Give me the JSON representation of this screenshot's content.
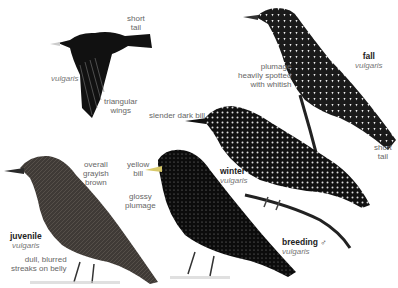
{
  "plate": {
    "species_latin": "vulgaris",
    "labels": {
      "flight_short_tail": [
        "short",
        "tail"
      ],
      "flight_vulgaris": "vulgaris",
      "flight_wings": [
        "triangular",
        "wings"
      ],
      "slender_bill": "slender dark bill",
      "fall_plumage": [
        "plumage",
        "heavily spotted",
        "with whitish"
      ],
      "fall_title": "fall",
      "fall_vulgaris": "vulgaris",
      "fall_short_tail": [
        "short",
        "tail"
      ],
      "juvenile_overall": [
        "overall",
        "grayish",
        "brown"
      ],
      "yellow_bill": [
        "yellow",
        "bill"
      ],
      "glossy_plumage": [
        "glossy",
        "plumage"
      ],
      "winter_title": "winter",
      "winter_vulgaris": "vulgaris",
      "juvenile_title": "juvenile",
      "juvenile_vulgaris": "vulgaris",
      "juvenile_belly": [
        "dull, blurred",
        "streaks on belly"
      ],
      "breeding_title": "breeding ♂",
      "breeding_vulgaris": "vulgaris"
    }
  }
}
